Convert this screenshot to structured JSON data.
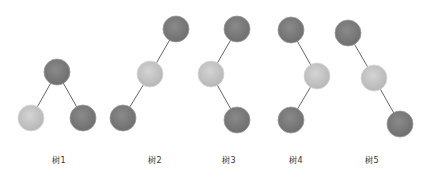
{
  "diagram": {
    "colors": {
      "dark_node": "#7a7a7a",
      "light_node": "#c4c4c4",
      "edge": "#666666"
    },
    "trees": [
      {
        "label": "树1",
        "nodes": [
          {
            "id": "root",
            "shade": "dark"
          },
          {
            "id": "left",
            "shade": "light"
          },
          {
            "id": "right",
            "shade": "dark"
          }
        ],
        "edges": [
          [
            "root",
            "left"
          ],
          [
            "root",
            "right"
          ]
        ]
      },
      {
        "label": "树2",
        "nodes": [
          {
            "id": "root",
            "shade": "dark"
          },
          {
            "id": "left",
            "shade": "light"
          },
          {
            "id": "left-left",
            "shade": "dark"
          }
        ],
        "edges": [
          [
            "root",
            "left"
          ],
          [
            "left",
            "left-left"
          ]
        ]
      },
      {
        "label": "树3",
        "nodes": [
          {
            "id": "root",
            "shade": "dark"
          },
          {
            "id": "left",
            "shade": "light"
          },
          {
            "id": "left-right",
            "shade": "dark"
          }
        ],
        "edges": [
          [
            "root",
            "left"
          ],
          [
            "left",
            "left-right"
          ]
        ]
      },
      {
        "label": "树4",
        "nodes": [
          {
            "id": "root",
            "shade": "dark"
          },
          {
            "id": "right",
            "shade": "light"
          },
          {
            "id": "right-left",
            "shade": "dark"
          }
        ],
        "edges": [
          [
            "root",
            "right"
          ],
          [
            "right",
            "right-left"
          ]
        ]
      },
      {
        "label": "树5",
        "nodes": [
          {
            "id": "root",
            "shade": "dark"
          },
          {
            "id": "right",
            "shade": "light"
          },
          {
            "id": "right-right",
            "shade": "dark"
          }
        ],
        "edges": [
          [
            "root",
            "right"
          ],
          [
            "right",
            "right-right"
          ]
        ]
      }
    ]
  }
}
